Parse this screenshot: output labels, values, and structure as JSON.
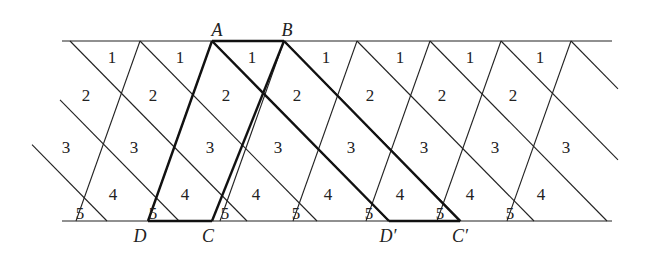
{
  "diagram": {
    "band": {
      "top_y": 41,
      "bottom_y": 221,
      "x_start": 62,
      "x_end": 612
    },
    "steep_lines_top_x": [
      140,
      212,
      284,
      357,
      430,
      501,
      571
    ],
    "steep_offset": -64,
    "diagonal_lines_top_x": [
      -70,
      2,
      70,
      140,
      212,
      284,
      357,
      430,
      501,
      571
    ],
    "diagonal_offset": 177,
    "points": {
      "A": {
        "label": "A",
        "x": 212,
        "y": 41
      },
      "B": {
        "label": "B",
        "x": 284,
        "y": 41
      },
      "C": {
        "label": "C",
        "x": 212,
        "y": 221
      },
      "D": {
        "label": "D",
        "x": 148,
        "y": 221
      },
      "D_prime": {
        "label": "D′",
        "x": 389,
        "y": 221
      },
      "C_prime": {
        "label": "C′",
        "x": 460,
        "y": 221
      }
    },
    "region_labels": {
      "row1": {
        "text": "1",
        "xs": [
          112,
          180,
          252,
          326,
          400,
          470,
          540
        ],
        "y": 63
      },
      "row2": {
        "text": "2",
        "xs": [
          86,
          153,
          226,
          297,
          370,
          442,
          513
        ],
        "y": 101
      },
      "row3": {
        "text": "3",
        "xs": [
          66,
          134,
          210,
          278,
          351,
          424,
          495,
          566
        ],
        "y": 153
      },
      "row4": {
        "text": "4",
        "xs": [
          113,
          185,
          256,
          328,
          400,
          470,
          541
        ],
        "y": 200
      },
      "row5": {
        "text": "5",
        "xs": [
          80,
          153,
          225,
          296,
          369,
          440,
          510
        ],
        "y": 219
      }
    }
  }
}
